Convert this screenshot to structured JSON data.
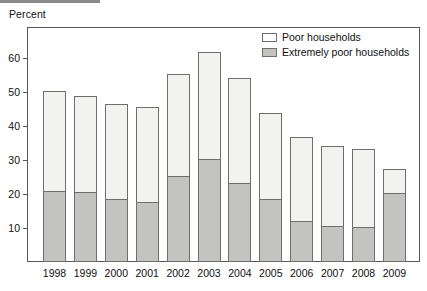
{
  "chart_data": {
    "type": "bar",
    "subtype": "stacked",
    "title": "",
    "xlabel": "",
    "ylabel": "Percent",
    "ylim": [
      0,
      68
    ],
    "yticks": [
      10,
      20,
      30,
      40,
      50,
      60
    ],
    "grid": false,
    "legend_position": "top-right",
    "categories": [
      "1998",
      "1999",
      "2000",
      "2001",
      "2002",
      "2003",
      "2004",
      "2005",
      "2006",
      "2007",
      "2008",
      "2009"
    ],
    "series": [
      {
        "name": "Poor households",
        "note": "total bar height (poor households, inclusive of extremely poor)",
        "color": "#f2f2f0",
        "values": [
          50.2,
          48.8,
          46.5,
          45.5,
          55.4,
          61.8,
          54.1,
          43.8,
          36.8,
          34.1,
          33.2,
          27.4
        ]
      },
      {
        "name": "Extremely poor households",
        "note": "lower shaded segment of each bar",
        "color": "#c3c3c1",
        "values": [
          20.5,
          20.4,
          18.2,
          17.3,
          25.0,
          30.0,
          23.0,
          18.2,
          11.8,
          10.3,
          10.0,
          20.0
        ]
      }
    ]
  },
  "axis": {
    "ylabel": "Percent",
    "ytick_labels": [
      "60",
      "50",
      "40",
      "30",
      "20",
      "10"
    ]
  },
  "legend": {
    "items": [
      {
        "label": "Poor households",
        "swatch": "legend-swatch-poor"
      },
      {
        "label": "Extremely poor households",
        "swatch": "legend-swatch-extremely-poor"
      }
    ]
  },
  "colors": {
    "poor_fill": "#f2f2f0",
    "extremely_poor_fill": "#c3c3c1",
    "frame": "#575757",
    "bar_stroke": "#6e6e6e",
    "text": "#101010"
  }
}
